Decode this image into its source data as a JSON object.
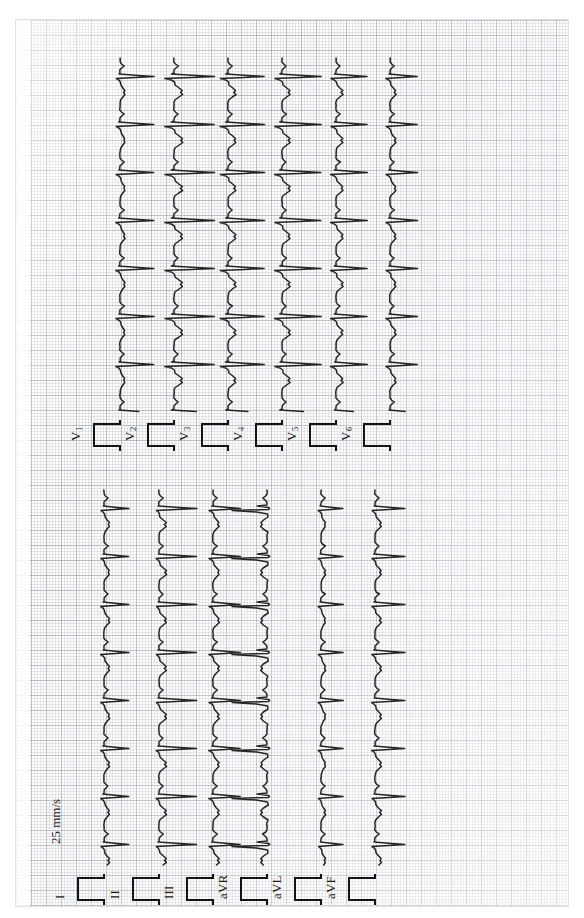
{
  "document": {
    "type": "ecg-printout",
    "orientation": "rotated-90-ccw",
    "paper_color": "#fdfdfc",
    "grid_major_color": "#787d8c",
    "grid_minor_color": "#8c91a0",
    "trace_color": "#131313"
  },
  "annotations": {
    "paper_speed": "25 mm/s"
  },
  "leads": [
    {
      "id": "I",
      "label": "I",
      "sub": "",
      "column": 0,
      "group": "limb"
    },
    {
      "id": "II",
      "label": "II",
      "sub": "",
      "column": 1,
      "group": "limb"
    },
    {
      "id": "III",
      "label": "III",
      "sub": "",
      "column": 2,
      "group": "limb"
    },
    {
      "id": "aVR",
      "label": "aVR",
      "sub": "",
      "column": 3,
      "group": "augmented"
    },
    {
      "id": "aVL",
      "label": "aVL",
      "sub": "",
      "column": 4,
      "group": "augmented"
    },
    {
      "id": "aVF",
      "label": "aVF",
      "sub": "",
      "column": 5,
      "group": "augmented"
    },
    {
      "id": "V1",
      "label": "V",
      "sub": "1",
      "column": 6,
      "group": "precordial"
    },
    {
      "id": "V2",
      "label": "V",
      "sub": "2",
      "column": 7,
      "group": "precordial"
    },
    {
      "id": "V3",
      "label": "V",
      "sub": "3",
      "column": 8,
      "group": "precordial"
    },
    {
      "id": "V4",
      "label": "V",
      "sub": "4",
      "column": 9,
      "group": "precordial"
    },
    {
      "id": "V5",
      "label": "V",
      "sub": "5",
      "column": 10,
      "group": "precordial"
    },
    {
      "id": "V6",
      "label": "V",
      "sub": "6",
      "column": 11,
      "group": "precordial"
    }
  ],
  "chart_data": {
    "type": "line",
    "xlabel": "Time",
    "ylabel": "Amplitude (mV)",
    "paper_speed_mm_per_s": 25,
    "gain_mm_per_mV": 10,
    "grid": "on",
    "grid_small_mm": 1,
    "grid_large_mm": 5,
    "legend": "lead labels at trace origin",
    "beats_per_strip": 11,
    "rr_interval_px": 48,
    "calibration_pulse": {
      "amplitude_mV": 1,
      "width_ms": 200,
      "present": true
    },
    "series": [
      {
        "name": "I",
        "qrs_polarity": "positive",
        "r_amplitude_mV": 0.95,
        "s_amplitude_mV": -0.12,
        "t_amplitude_mV": 0.22,
        "morphology": "small R, notched T"
      },
      {
        "name": "II",
        "qrs_polarity": "positive",
        "r_amplitude_mV": 1.45,
        "s_amplitude_mV": -0.1,
        "t_amplitude_mV": 0.3,
        "morphology": "tall R, notched T"
      },
      {
        "name": "III",
        "qrs_polarity": "positive",
        "r_amplitude_mV": 1.05,
        "s_amplitude_mV": -0.15,
        "t_amplitude_mV": 0.25,
        "morphology": "R with notched T"
      },
      {
        "name": "aVR",
        "qrs_polarity": "negative",
        "r_amplitude_mV": 0.1,
        "s_amplitude_mV": -1.35,
        "t_amplitude_mV": -0.25,
        "morphology": "deep QS, inverted T"
      },
      {
        "name": "aVL",
        "qrs_polarity": "positive",
        "r_amplitude_mV": 0.85,
        "s_amplitude_mV": -0.1,
        "t_amplitude_mV": 0.18,
        "morphology": "modest R"
      },
      {
        "name": "aVF",
        "qrs_polarity": "positive",
        "r_amplitude_mV": 1.15,
        "s_amplitude_mV": -0.12,
        "t_amplitude_mV": 0.26,
        "morphology": "R with upright T"
      },
      {
        "name": "V1",
        "qrs_polarity": "positive",
        "r_amplitude_mV": 1.3,
        "s_amplitude_mV": -0.15,
        "t_amplitude_mV": 0.2,
        "morphology": "sharp narrow complex"
      },
      {
        "name": "V2",
        "qrs_polarity": "positive",
        "r_amplitude_mV": 1.55,
        "s_amplitude_mV": -0.35,
        "t_amplitude_mV": 0.35,
        "morphology": "large complex, deep S"
      },
      {
        "name": "V3",
        "qrs_polarity": "positive",
        "r_amplitude_mV": 1.4,
        "s_amplitude_mV": -0.3,
        "t_amplitude_mV": 0.32,
        "morphology": "large biphasic"
      },
      {
        "name": "V4",
        "qrs_polarity": "positive",
        "r_amplitude_mV": 1.5,
        "s_amplitude_mV": -0.28,
        "t_amplitude_mV": 0.33,
        "morphology": "tall R"
      },
      {
        "name": "V5",
        "qrs_polarity": "positive",
        "r_amplitude_mV": 1.2,
        "s_amplitude_mV": -0.2,
        "t_amplitude_mV": 0.28,
        "morphology": "tall R, notched T"
      },
      {
        "name": "V6",
        "qrs_polarity": "positive",
        "r_amplitude_mV": 1.05,
        "s_amplitude_mV": -0.15,
        "t_amplitude_mV": 0.24,
        "morphology": "R with upright T"
      }
    ]
  }
}
